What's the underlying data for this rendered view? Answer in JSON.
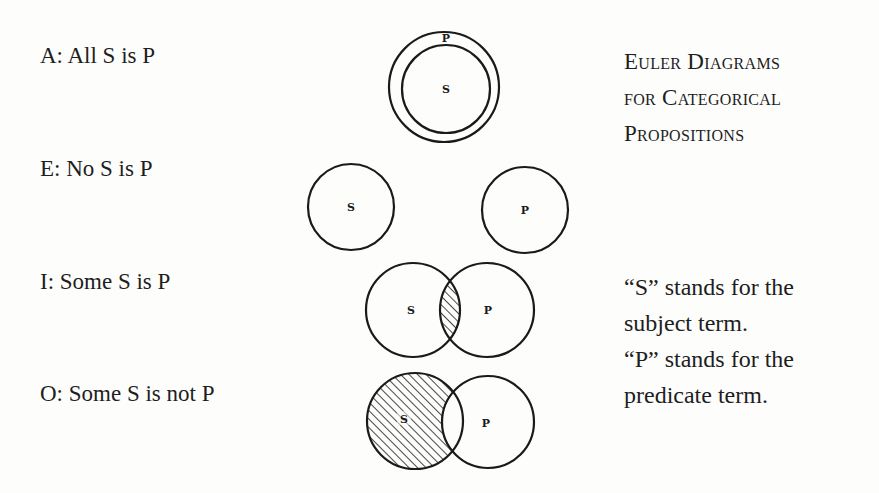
{
  "title": {
    "lines": [
      "Euler Diagrams",
      "for Categorical",
      "Propositions"
    ]
  },
  "propositions": [
    {
      "type": "A",
      "label": "A: All S is P",
      "relation": "S inside P"
    },
    {
      "type": "E",
      "label": "E: No S is P",
      "relation": "S and P disjoint"
    },
    {
      "type": "I",
      "label": "I: Some S is P",
      "relation": "S and P overlap, intersection shaded"
    },
    {
      "type": "O",
      "label": "O: Some S is not P",
      "relation": "S and P overlap, S outside P shaded"
    }
  ],
  "circle_labels": {
    "subject": "S",
    "predicate": "P"
  },
  "notes": {
    "lines": [
      "“S” stands for the",
      "subject term.",
      "“P” stands for the",
      "predicate term."
    ]
  },
  "colors": {
    "background": "#fdfdfc",
    "ink": "#1a1a1a"
  }
}
